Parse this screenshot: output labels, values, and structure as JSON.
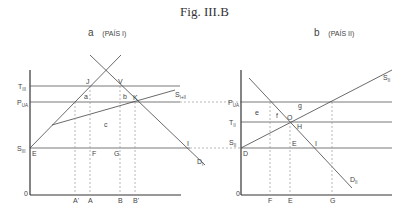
{
  "figure": {
    "title_prefix": "Fig.",
    "title_number": "III.B"
  },
  "panels": [
    {
      "id": "a",
      "letter": "a",
      "country": "(PAÍS I)",
      "y_labels": {
        "top": "T",
        "top_sub": "III",
        "mid": "P",
        "mid_sub": "UA",
        "low": "S",
        "low_sub": "III",
        "origin": "0"
      },
      "x_labels": [
        "A'",
        "A",
        "B",
        "B'"
      ],
      "point_labels": {
        "E": "E",
        "J": "J",
        "V": "V",
        "K": "K",
        "F": "F",
        "G": "G",
        "I": "I"
      },
      "area_labels": {
        "a": "a",
        "b": "b",
        "c": "c"
      },
      "curve_labels": {
        "supply_combined": "S",
        "supply_combined_sub": "I+II",
        "demand": "D",
        "demand_sub": "I"
      }
    },
    {
      "id": "b",
      "letter": "b",
      "country": "(PAÍS II)",
      "y_labels": {
        "top": "P",
        "top_sub": "UA",
        "mid": "T",
        "mid_sub": "II",
        "low": "S",
        "low_sub": "II",
        "origin": "0"
      },
      "x_labels": [
        "F",
        "E",
        "G"
      ],
      "point_labels": {
        "D": "D",
        "O": "O",
        "H": "H",
        "E": "E",
        "I": "I"
      },
      "area_labels": {
        "e": "e",
        "f": "f",
        "g": "g"
      },
      "curve_labels": {
        "supply": "S",
        "supply_sub": "II",
        "demand": "D",
        "demand_sub": "II"
      }
    }
  ],
  "colors": {
    "axis": "#333333",
    "line": "#555555",
    "dashed": "#999999",
    "text": "#444444"
  }
}
